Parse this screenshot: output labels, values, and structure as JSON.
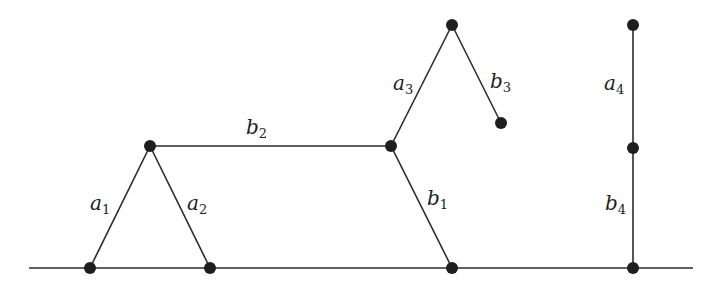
{
  "diagram": {
    "title": "",
    "colors": {
      "stroke": "#2b2b2b",
      "vertex": "#1e1e1e",
      "background": "#ffffff"
    },
    "baseline": {
      "x1": 29,
      "y1": 268,
      "x2": 693,
      "y2": 268
    },
    "vertices": [
      {
        "id": "v1",
        "x": 90,
        "y": 268
      },
      {
        "id": "v2",
        "x": 210,
        "y": 268
      },
      {
        "id": "v3",
        "x": 150,
        "y": 146
      },
      {
        "id": "v4",
        "x": 391,
        "y": 146
      },
      {
        "id": "v5",
        "x": 452,
        "y": 268
      },
      {
        "id": "v6",
        "x": 452,
        "y": 25
      },
      {
        "id": "v7",
        "x": 501,
        "y": 123
      },
      {
        "id": "v8",
        "x": 633,
        "y": 25
      },
      {
        "id": "v9",
        "x": 633,
        "y": 148
      },
      {
        "id": "v10",
        "x": 633,
        "y": 268
      }
    ],
    "edges": [
      {
        "name": "a1",
        "letter": "a",
        "subscript": "1",
        "from": "v1",
        "to": "v3",
        "label_x": 90,
        "label_y": 210
      },
      {
        "name": "a2",
        "letter": "a",
        "subscript": "2",
        "from": "v3",
        "to": "v2",
        "label_x": 187,
        "label_y": 210
      },
      {
        "name": "b2",
        "letter": "b",
        "subscript": "2",
        "from": "v3",
        "to": "v4",
        "label_x": 246,
        "label_y": 134
      },
      {
        "name": "b1",
        "letter": "b",
        "subscript": "1",
        "from": "v4",
        "to": "v5",
        "label_x": 427,
        "label_y": 205
      },
      {
        "name": "a3",
        "letter": "a",
        "subscript": "3",
        "from": "v4",
        "to": "v6",
        "label_x": 393,
        "label_y": 90
      },
      {
        "name": "b3",
        "letter": "b",
        "subscript": "3",
        "from": "v6",
        "to": "v7",
        "label_x": 490,
        "label_y": 88
      },
      {
        "name": "a4",
        "letter": "a",
        "subscript": "4",
        "from": "v8",
        "to": "v9",
        "label_x": 604,
        "label_y": 90
      },
      {
        "name": "b4",
        "letter": "b",
        "subscript": "4",
        "from": "v9",
        "to": "v10",
        "label_x": 605,
        "label_y": 210
      }
    ]
  }
}
